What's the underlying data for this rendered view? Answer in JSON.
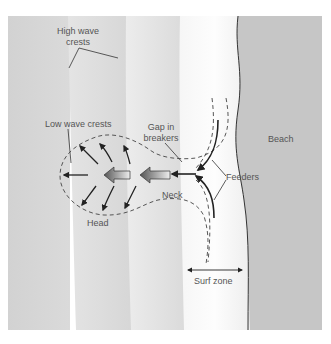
{
  "diagram": {
    "labels": {
      "high_wave_crests_line1": "High wave",
      "high_wave_crests_line2": "crests",
      "low_wave_crests": "Low wave crests",
      "gap_line1": "Gap in",
      "gap_line2": "breakers",
      "feeders": "Feeders",
      "neck": "Neck",
      "head": "Head",
      "beach": "Beach",
      "surf_zone": "Surf zone"
    },
    "colors": {
      "water_dark": "#cfcfcf",
      "water_mid": "#dcdcdc",
      "water_light": "#efefef",
      "crest_white": "#fafafa",
      "beach": "#c4c4c4",
      "line": "#333333",
      "label": "#555555"
    }
  }
}
